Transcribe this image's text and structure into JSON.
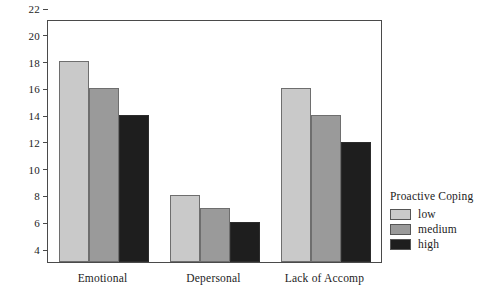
{
  "chart_data": {
    "type": "bar",
    "title": "",
    "xlabel": "",
    "ylabel": "",
    "categories": [
      "Emotional",
      "Depersonal",
      "Lack of Accomp"
    ],
    "series": [
      {
        "name": "low",
        "values": [
          19,
          9,
          17
        ],
        "color": "#c9c9c9"
      },
      {
        "name": "medium",
        "values": [
          17,
          8,
          15
        ],
        "color": "#9a9a9a"
      },
      {
        "name": "high",
        "values": [
          15,
          7,
          13
        ],
        "color": "#1e1e1e"
      }
    ],
    "ylim": [
      4,
      22
    ],
    "ytick_step": 2,
    "yticks": [
      "22",
      "20",
      "18",
      "16",
      "14",
      "12",
      "10",
      "8",
      "6",
      "4"
    ],
    "grid": false,
    "legend_position": "right",
    "legend_title": "Proactive Coping",
    "frame": true,
    "axis_color": "#4a4a4a"
  },
  "legend": {
    "title": "Proactive Coping",
    "items": [
      {
        "label": "low",
        "color": "#c9c9c9"
      },
      {
        "label": "medium",
        "color": "#9a9a9a"
      },
      {
        "label": "high",
        "color": "#1e1e1e"
      }
    ]
  }
}
